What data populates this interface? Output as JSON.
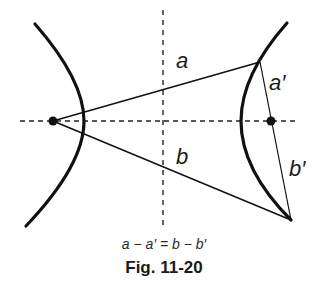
{
  "figure": {
    "labels": {
      "a": "a",
      "a_prime": "a′",
      "b": "b",
      "b_prime": "b′"
    },
    "equation": "a − a′ = b − b′",
    "caption": "Fig. 11-20"
  },
  "geometry": {
    "left_focus": [
      53,
      121
    ],
    "right_focus": [
      271,
      121
    ],
    "point_upper": [
      260,
      62
    ],
    "point_lower": [
      291,
      220
    ],
    "horizontal_axis_y": 121,
    "vertical_axis_x": 163
  },
  "colors": {
    "stroke": "#111111",
    "background": "#ffffff"
  }
}
